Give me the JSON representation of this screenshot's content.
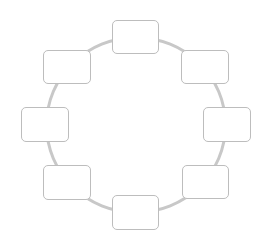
{
  "diagram": {
    "type": "cycle",
    "ring": {
      "cx": 136,
      "cy": 125,
      "rx": 91,
      "ry": 89,
      "stroke": "#c8c8c8",
      "stroke_width": 3.5
    },
    "node_style": {
      "fill": "#ffffff",
      "stroke": "#bdbdbd"
    },
    "nodes": [
      {
        "id": "top",
        "label": "",
        "x": 112,
        "y": 20,
        "w": 47,
        "h": 34
      },
      {
        "id": "upper-right",
        "label": "",
        "x": 181,
        "y": 50,
        "w": 48,
        "h": 34
      },
      {
        "id": "right",
        "label": "",
        "x": 203,
        "y": 107,
        "w": 48,
        "h": 35
      },
      {
        "id": "lower-right",
        "label": "",
        "x": 182,
        "y": 165,
        "w": 47,
        "h": 34
      },
      {
        "id": "bottom",
        "label": "",
        "x": 112,
        "y": 195,
        "w": 47,
        "h": 35
      },
      {
        "id": "lower-left",
        "label": "",
        "x": 43,
        "y": 165,
        "w": 48,
        "h": 35
      },
      {
        "id": "left",
        "label": "",
        "x": 21,
        "y": 107,
        "w": 48,
        "h": 35
      },
      {
        "id": "upper-left",
        "label": "",
        "x": 43,
        "y": 50,
        "w": 48,
        "h": 34
      }
    ]
  }
}
